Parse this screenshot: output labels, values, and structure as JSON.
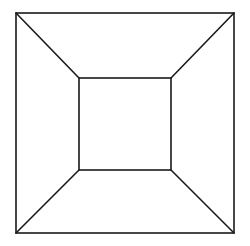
{
  "diagram": {
    "title": "",
    "stroke_color": "#1a1a1a",
    "background_color": "#ffffff",
    "stroke_width": 1.6,
    "outer_square": {
      "x1": 16,
      "y1": 13,
      "x2": 234,
      "y2": 233
    },
    "inner_square": {
      "x1": 79,
      "y1": 78,
      "x2": 171,
      "y2": 170
    },
    "connectors": [
      {
        "name": "top-left",
        "from": [
          16,
          13
        ],
        "to": [
          79,
          78
        ]
      },
      {
        "name": "top-right",
        "from": [
          234,
          13
        ],
        "to": [
          171,
          78
        ]
      },
      {
        "name": "bottom-right",
        "from": [
          234,
          233
        ],
        "to": [
          171,
          170
        ]
      },
      {
        "name": "bottom-left",
        "from": [
          16,
          233
        ],
        "to": [
          79,
          170
        ]
      }
    ]
  }
}
